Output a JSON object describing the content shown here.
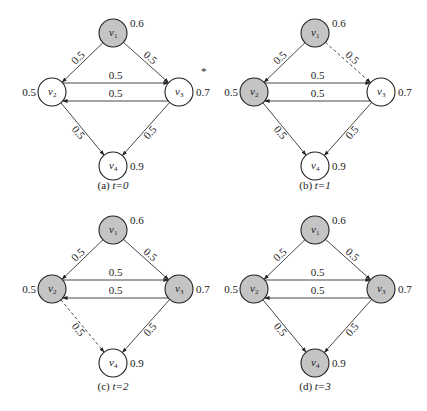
{
  "figure": {
    "colors": {
      "active_fill": "#c4c4c4",
      "inactive_fill": "#ffffff",
      "stroke": "#222222"
    },
    "node_radius": 14,
    "nodes": [
      {
        "id": "v1",
        "name": "v",
        "sub": "1",
        "threshold": "0.6",
        "dx": 0,
        "dy": 0,
        "thr_side": "right"
      },
      {
        "id": "v2",
        "name": "v",
        "sub": "2",
        "threshold": "0.5",
        "dx": -61,
        "dy": 59,
        "thr_side": "left"
      },
      {
        "id": "v3",
        "name": "v",
        "sub": "3",
        "threshold": "0.7",
        "dx": 66,
        "dy": 59,
        "thr_side": "right"
      },
      {
        "id": "v4",
        "name": "v",
        "sub": "4",
        "threshold": "0.9",
        "dx": 0,
        "dy": 133,
        "thr_side": "right"
      }
    ],
    "edges": [
      {
        "from": "v1",
        "to": "v2",
        "weight": "0.5"
      },
      {
        "from": "v1",
        "to": "v3",
        "weight": "0.5"
      },
      {
        "from": "v2",
        "to": "v3",
        "weight": "0.5"
      },
      {
        "from": "v3",
        "to": "v2",
        "weight": "0.5"
      },
      {
        "from": "v2",
        "to": "v4",
        "weight": "0.5"
      },
      {
        "from": "v3",
        "to": "v4",
        "weight": "0.5"
      }
    ],
    "panels": [
      {
        "id": "a",
        "caption_label": "(a)",
        "caption_t": "t=0",
        "origin": [
          113,
          33
        ],
        "caption_y": 189,
        "active": [
          "v1"
        ],
        "dashed": [],
        "asterisk": true
      },
      {
        "id": "b",
        "caption_label": "(b)",
        "caption_t": "t=1",
        "origin": [
          315,
          33
        ],
        "caption_y": 189,
        "active": [
          "v1",
          "v2"
        ],
        "dashed": [
          "v1-v3"
        ],
        "asterisk": false
      },
      {
        "id": "c",
        "caption_label": "(c)",
        "caption_t": "t=2",
        "origin": [
          113,
          230
        ],
        "caption_y": 390,
        "active": [
          "v1",
          "v2",
          "v3"
        ],
        "dashed": [
          "v2-v4"
        ],
        "asterisk": false
      },
      {
        "id": "d",
        "caption_label": "(d)",
        "caption_t": "t=3",
        "origin": [
          315,
          230
        ],
        "caption_y": 390,
        "active": [
          "v1",
          "v2",
          "v3",
          "v4"
        ],
        "dashed": [],
        "asterisk": false
      }
    ]
  }
}
